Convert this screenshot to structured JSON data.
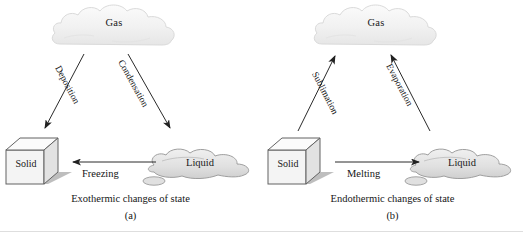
{
  "figure": {
    "width": 523,
    "height": 232,
    "colors": {
      "cloud_fill": "#f2f2f2",
      "cloud_stroke": "#d8d8d8",
      "cube_face": "#f0f0f0",
      "cube_stroke": "#6b6b6b",
      "shadow": "#9a9a9a",
      "liquid_fill": "#e3e3e3",
      "liquid_stroke": "#9d9d9d",
      "arrow": "#2a2a2a",
      "text": "#161616"
    }
  },
  "panels": [
    {
      "id": "a",
      "letter": "(a)",
      "caption": "Exothermic changes of state",
      "states": {
        "gas": "Gas",
        "solid": "Solid",
        "liquid": "Liquid"
      },
      "transitions": [
        {
          "name": "deposition",
          "label": "Deposition",
          "from": "gas",
          "to": "solid",
          "direction": "down-left"
        },
        {
          "name": "condensation",
          "label": "Condensation",
          "from": "gas",
          "to": "liquid",
          "direction": "down-right"
        },
        {
          "name": "freezing",
          "label": "Freezing",
          "from": "liquid",
          "to": "solid",
          "direction": "left"
        }
      ]
    },
    {
      "id": "b",
      "letter": "(b)",
      "caption": "Endothermic changes of state",
      "states": {
        "gas": "Gas",
        "solid": "Solid",
        "liquid": "Liquid"
      },
      "transitions": [
        {
          "name": "sublimation",
          "label": "Sublimation",
          "from": "solid",
          "to": "gas",
          "direction": "up-right"
        },
        {
          "name": "evaporation",
          "label": "Evaporation",
          "from": "liquid",
          "to": "gas",
          "direction": "up-left"
        },
        {
          "name": "melting",
          "label": "Melting",
          "from": "solid",
          "to": "liquid",
          "direction": "right"
        }
      ]
    }
  ]
}
